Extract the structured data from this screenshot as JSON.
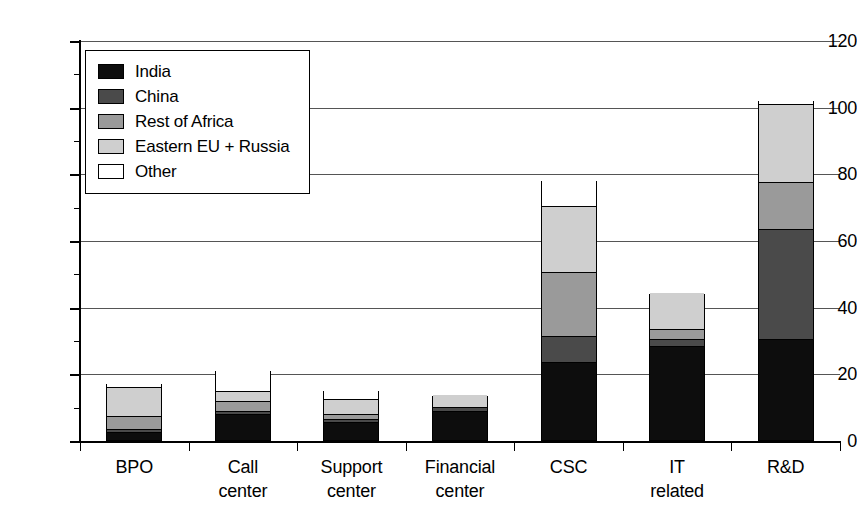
{
  "chart_data": {
    "type": "bar",
    "subtype": "stacked-bar",
    "title": "",
    "xlabel": "",
    "ylabel": "",
    "ylim": [
      0,
      120
    ],
    "yticks": [
      0,
      20,
      40,
      60,
      80,
      100,
      120
    ],
    "ytick_labels": [
      "0",
      "20",
      "40",
      "60",
      "80",
      "100",
      "120"
    ],
    "minor_tick_interval": 10,
    "grid": true,
    "grid_axis": "y",
    "legend_position": "upper left (inside plot)",
    "stack_order_bottom_to_top": [
      "India",
      "China",
      "Rest of Africa",
      "Eastern EU + Russia",
      "Other"
    ],
    "categories": [
      "BPO",
      "Call center",
      "Support center",
      "Financial center",
      "CSC",
      "IT related",
      "R&D"
    ],
    "category_lines": [
      [
        "BPO",
        ""
      ],
      [
        "Call",
        "center"
      ],
      [
        "Support",
        "center"
      ],
      [
        "Financial",
        "center"
      ],
      [
        "CSC",
        ""
      ],
      [
        "IT",
        "related"
      ],
      [
        "R&D",
        ""
      ]
    ],
    "series": [
      {
        "name": "India",
        "color": "#0d0d0d",
        "values": [
          2.0,
          7.5,
          5.0,
          8.5,
          23.0,
          28.0,
          30.0
        ]
      },
      {
        "name": "China",
        "color": "#4a4a4a",
        "values": [
          1.0,
          1.0,
          1.0,
          1.0,
          8.0,
          2.0,
          33.0
        ]
      },
      {
        "name": "Rest of Africa",
        "color": "#9a9a9a",
        "values": [
          4.0,
          3.0,
          1.5,
          0.0,
          19.0,
          3.0,
          14.0
        ]
      },
      {
        "name": "Eastern EU + Russia",
        "color": "#cfcfcf",
        "values": [
          8.5,
          3.0,
          4.5,
          4.0,
          20.0,
          11.0,
          23.5
        ]
      },
      {
        "name": "Other",
        "color": "#ffffff",
        "values": [
          1.5,
          6.5,
          3.0,
          0.0,
          8.0,
          0.0,
          1.5
        ]
      }
    ],
    "totals": [
      17.0,
      21.0,
      15.0,
      13.5,
      78.0,
      44.0,
      102.0
    ]
  },
  "legend": {
    "items": [
      {
        "label": "India",
        "swatch": "sw-india"
      },
      {
        "label": "China",
        "swatch": "sw-china"
      },
      {
        "label": "Rest of Africa",
        "swatch": "sw-africa"
      },
      {
        "label": "Eastern EU + Russia",
        "swatch": "sw-eastern"
      },
      {
        "label": "Other",
        "swatch": "sw-other"
      }
    ]
  }
}
